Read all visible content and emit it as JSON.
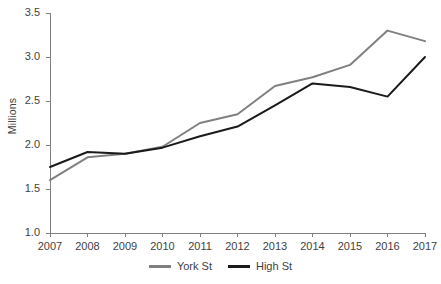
{
  "chart_data": {
    "type": "line",
    "title": "",
    "xlabel": "",
    "ylabel": "Millions",
    "categories": [
      "2007",
      "2008",
      "2009",
      "2010",
      "2011",
      "2012",
      "2013",
      "2014",
      "2015",
      "2016",
      "2017"
    ],
    "x": [
      2007,
      2008,
      2009,
      2010,
      2011,
      2012,
      2013,
      2014,
      2015,
      2016,
      2017
    ],
    "ylim": [
      1.0,
      3.5
    ],
    "yticks": [
      "1.0",
      "1.5",
      "2.0",
      "2.5",
      "3.0",
      "3.5"
    ],
    "ytick_values": [
      1.0,
      1.5,
      2.0,
      2.5,
      3.0,
      3.5
    ],
    "grid": false,
    "legend_position": "bottom",
    "series": [
      {
        "name": "York St",
        "color": "#808080",
        "values": [
          1.6,
          1.86,
          1.9,
          1.98,
          2.25,
          2.35,
          2.67,
          2.77,
          2.91,
          3.3,
          3.18
        ]
      },
      {
        "name": "High St",
        "color": "#1a1a1a",
        "values": [
          1.75,
          1.92,
          1.9,
          1.97,
          2.1,
          2.21,
          2.45,
          2.7,
          2.66,
          2.55,
          3.0
        ]
      }
    ]
  },
  "legend": {
    "items": [
      {
        "label": "York St",
        "color": "#808080"
      },
      {
        "label": "High St",
        "color": "#1a1a1a"
      }
    ]
  },
  "axes": {
    "y_title": "Millions",
    "axis_color": "#808080"
  }
}
